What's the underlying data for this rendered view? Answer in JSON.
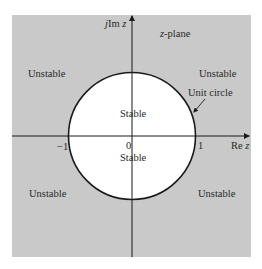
{
  "diagram": {
    "title": "z-plane",
    "colors": {
      "unstable_fill": "#c9c9c9",
      "stable_fill": "#ffffff",
      "axis": "#1a1a1a",
      "circle": "#1a1a1a",
      "text": "#2a2a2a"
    },
    "axes": {
      "imag_label_prefix": "j",
      "imag_label_main": "Im",
      "imag_label_var": "z",
      "real_label_main": "Re",
      "real_label_var": "z"
    },
    "ticks": {
      "minus_one": "−1",
      "zero": "0",
      "one": "1"
    },
    "plane_label_var": "z",
    "plane_label_rest": "-plane",
    "regions": {
      "unstable_top_left": "Unstable",
      "unstable_top_right": "Unstable",
      "unstable_bottom_left": "Unstable",
      "unstable_bottom_right": "Unstable",
      "stable_upper": "Stable",
      "stable_lower": "Stable"
    },
    "annotations": {
      "unit_circle": "Unit circle"
    }
  }
}
